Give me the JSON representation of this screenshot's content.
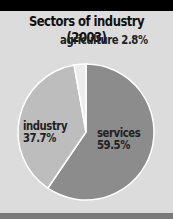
{
  "chart_data": {
    "type": "pie",
    "title": "Sectors of industry (2003)",
    "categories": [
      "services",
      "industry",
      "agriculture"
    ],
    "values": [
      59.5,
      37.7,
      2.8
    ],
    "labels": [
      "services 59.5%",
      "industry 37.7%",
      "agriculture 2.8%"
    ],
    "colors": [
      "#8c8c8c",
      "#bdbdbd",
      "#ececec"
    ],
    "start_angle": "12 o'clock, clockwise",
    "legend": "inline labels"
  },
  "labels": {
    "agriculture_name": "agriculture",
    "agriculture_value": "2.8%",
    "industry_name": "industry",
    "industry_value": "37.7%",
    "services_name": "services",
    "services_value": "59.5%"
  }
}
